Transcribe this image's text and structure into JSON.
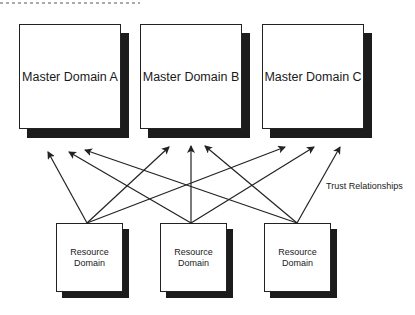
{
  "diagram": {
    "master_domains": [
      {
        "id": "A",
        "label": "Master  Domain A"
      },
      {
        "id": "B",
        "label": "Master  Domain B"
      },
      {
        "id": "C",
        "label": "Master  Domain C"
      }
    ],
    "resource_domains": [
      {
        "id": "R1",
        "label_line1": "Resource",
        "label_line2": "Domain"
      },
      {
        "id": "R2",
        "label_line1": "Resource",
        "label_line2": "Domain"
      },
      {
        "id": "R3",
        "label_line1": "Resource",
        "label_line2": "Domain"
      }
    ],
    "relationship_label": "Trust Relationships",
    "edges": [
      {
        "from": "R1",
        "to": "A"
      },
      {
        "from": "R1",
        "to": "B"
      },
      {
        "from": "R1",
        "to": "C"
      },
      {
        "from": "R2",
        "to": "A"
      },
      {
        "from": "R2",
        "to": "B"
      },
      {
        "from": "R2",
        "to": "C"
      },
      {
        "from": "R3",
        "to": "A"
      },
      {
        "from": "R3",
        "to": "B"
      },
      {
        "from": "R3",
        "to": "C"
      }
    ],
    "colors": {
      "line": "#222222",
      "shadow": "#1c1c1c",
      "background": "#ffffff"
    }
  }
}
